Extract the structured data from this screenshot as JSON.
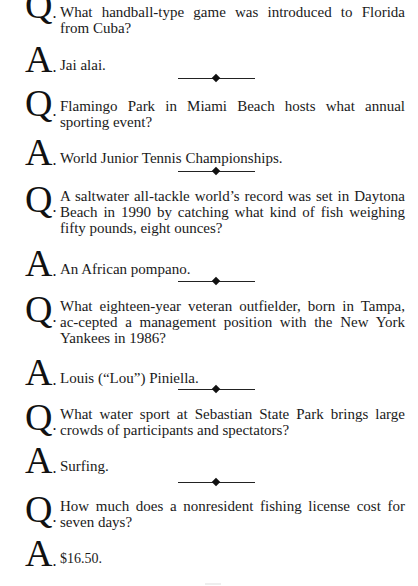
{
  "items": [
    {
      "q_label": "Q",
      "question": "What handball-type game was introduced to Florida from Cuba?",
      "a_label": "A",
      "answer": "Jai alai."
    },
    {
      "q_label": "Q",
      "question": "Flamingo Park in Miami Beach hosts what annual sporting event?",
      "a_label": "A",
      "answer": "World Junior Tennis Championships."
    },
    {
      "q_label": "Q",
      "question": "A saltwater all-tackle world’s record was set in Daytona Beach in 1990 by catching what kind of fish weighing fifty pounds, eight ounces?",
      "a_label": "A",
      "answer": "An African pompano."
    },
    {
      "q_label": "Q",
      "question": "What eighteen-year veteran outfielder, born in Tampa, ac-cepted a management position with the New York Yankees in 1986?",
      "a_label": "A",
      "answer": "Louis (“Lou”) Piniella."
    },
    {
      "q_label": "Q",
      "question": "What water sport at Sebastian State Park brings large crowds of participants and spectators?",
      "a_label": "A",
      "answer": "Surfing."
    },
    {
      "q_label": "Q",
      "question": "How much does a nonresident fishing license cost for seven days?",
      "a_label": "A",
      "answer": "$16.50."
    }
  ],
  "separator_icon": "diamond-rule"
}
